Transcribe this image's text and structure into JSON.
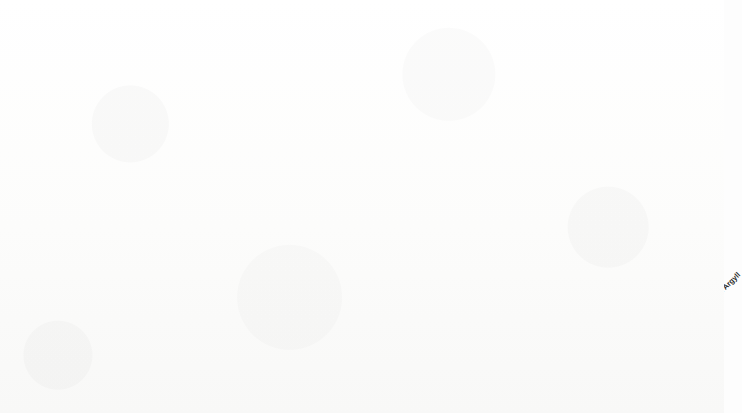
{
  "chart_data": {
    "type": "bar",
    "title": "Scottish Districts Expenditure",
    "xlabel": "",
    "ylabel": "",
    "ylim": [
      0,
      250000
    ],
    "ytick_labels": [
      "£0.00",
      "£50,000.00",
      "£100,000.00",
      "£150,000.00",
      "£200,000.00",
      "£250,000.00"
    ],
    "ytick_values": [
      0,
      50000,
      100000,
      150000,
      200000,
      250000
    ],
    "grid": true,
    "legend": "none",
    "bar_color": "#7d7d7d",
    "bar_edge_color": "#3a3a3a",
    "categories": [
      "16 Glasgow",
      "1 Edinburgh",
      "17 Hamilton",
      "14 Paisley",
      "29 Dundee",
      "15 Greenock",
      "3 Lothian",
      "43 Uist",
      "31 Aberdeen",
      "18 Dumbarton",
      "22 Falkirk",
      "28 Perth",
      "30 Angus",
      "37 Inverness",
      "23 Stirling",
      "10 Ayr",
      "39 Ross",
      "36 Abernethy",
      "2 West Lothian",
      "4 Melrose and Peebles",
      "40 Sutherland",
      "21 Lorn and Mull",
      "45 Orkney",
      "41 Caithness",
      "8 Dumfries and Kirkcudbright",
      "33 Gordon",
      "27 Dunkeld and Meigle",
      "24 Dunfermline",
      "19 South Argyll"
    ],
    "values": [
      220000,
      71000,
      55000,
      49000,
      46500,
      31500,
      25000,
      24500,
      22500,
      20500,
      17000,
      13500,
      13000,
      12500,
      12500,
      12000,
      12000,
      11500,
      10000,
      8500,
      7000,
      6500,
      6000,
      5500,
      4500,
      4000,
      3500,
      3000,
      800
    ]
  }
}
